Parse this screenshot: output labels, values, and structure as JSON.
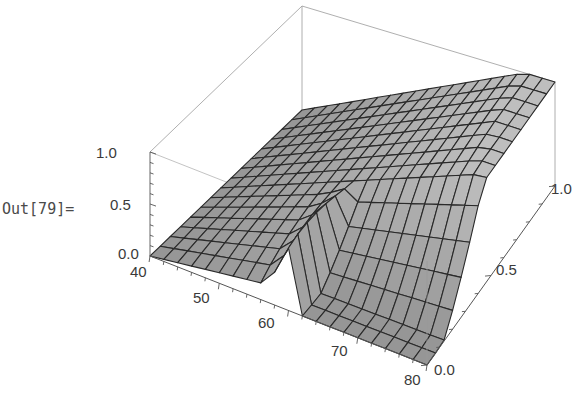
{
  "cell": {
    "out_label": "Out[79]="
  },
  "chart_data": {
    "type": "surface3d",
    "title": "",
    "x_axis": {
      "label": "",
      "range": [
        40,
        80
      ],
      "ticks": [
        "40",
        "50",
        "60",
        "70",
        "80"
      ]
    },
    "y_axis": {
      "label": "",
      "range": [
        0.0,
        1.0
      ],
      "ticks": [
        "0.0",
        "0.5",
        "1.0"
      ]
    },
    "z_axis": {
      "label": "",
      "range": [
        0.0,
        1.0
      ],
      "ticks": [
        "0.0",
        "0.5",
        "1.0"
      ]
    },
    "mesh": {
      "x_lines": 20,
      "y_lines": 15
    },
    "colors": {
      "surface": "#a8a8a8",
      "mesh": "#2a2a2a",
      "box": "#9a9a9a",
      "axis": "#555555"
    }
  }
}
